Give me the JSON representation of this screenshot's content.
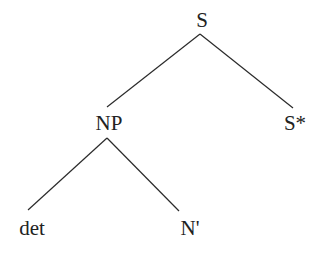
{
  "diagram": {
    "type": "syntax-tree",
    "nodes": [
      {
        "id": "root",
        "label": "S"
      },
      {
        "id": "np",
        "label": "NP"
      },
      {
        "id": "sfoot",
        "label": "S*"
      },
      {
        "id": "det",
        "label": "det"
      },
      {
        "id": "nbar",
        "label": "N'"
      }
    ],
    "edges": [
      {
        "from": "S",
        "to": "NP"
      },
      {
        "from": "S",
        "to": "S*"
      },
      {
        "from": "NP",
        "to": "det"
      },
      {
        "from": "NP",
        "to": "N'"
      }
    ]
  }
}
